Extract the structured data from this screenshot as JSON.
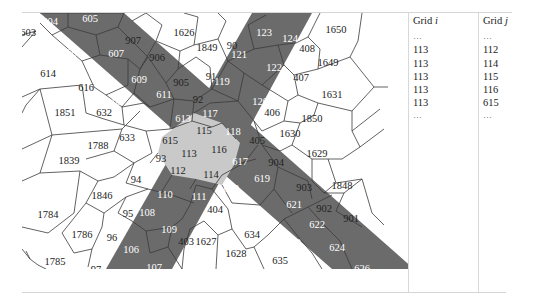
{
  "figure": {
    "colors": {
      "band_dark": "#6b6b6b",
      "intersection_light": "#c9c9c9",
      "cell_white": "#ffffff",
      "edge": "#3a3a3a"
    },
    "cells": [
      {
        "id": "604",
        "x": 28,
        "y": 6,
        "style": "dark"
      },
      {
        "id": "605",
        "x": 68,
        "y": 3,
        "style": "dark"
      },
      {
        "id": "603",
        "x": 6,
        "y": 17,
        "style": "white"
      },
      {
        "id": "606",
        "x": 52,
        "y": 37,
        "style": "dark"
      },
      {
        "id": "607",
        "x": 94,
        "y": 38,
        "style": "dark"
      },
      {
        "id": "907",
        "x": 111,
        "y": 25,
        "style": "white"
      },
      {
        "id": "1626",
        "x": 162,
        "y": 17,
        "style": "white"
      },
      {
        "id": "1849",
        "x": 185,
        "y": 32,
        "style": "white"
      },
      {
        "id": "90",
        "x": 210,
        "y": 30,
        "style": "white"
      },
      {
        "id": "123",
        "x": 242,
        "y": 17,
        "style": "dark"
      },
      {
        "id": "124",
        "x": 268,
        "y": 23,
        "style": "dark"
      },
      {
        "id": "408",
        "x": 285,
        "y": 33,
        "style": "white"
      },
      {
        "id": "1650",
        "x": 314,
        "y": 14,
        "style": "white"
      },
      {
        "id": "1649",
        "x": 306,
        "y": 47,
        "style": "white"
      },
      {
        "id": "614",
        "x": 26,
        "y": 58,
        "style": "white"
      },
      {
        "id": "608",
        "x": 75,
        "y": 59,
        "style": "dark"
      },
      {
        "id": "609",
        "x": 117,
        "y": 64,
        "style": "dark"
      },
      {
        "id": "906",
        "x": 135,
        "y": 42,
        "style": "white"
      },
      {
        "id": "121",
        "x": 217,
        "y": 39,
        "style": "dark"
      },
      {
        "id": "122",
        "x": 252,
        "y": 52,
        "style": "dark"
      },
      {
        "id": "407",
        "x": 279,
        "y": 62,
        "style": "white"
      },
      {
        "id": "616",
        "x": 64,
        "y": 72,
        "style": "white"
      },
      {
        "id": "905",
        "x": 159,
        "y": 67,
        "style": "white"
      },
      {
        "id": "91",
        "x": 189,
        "y": 61,
        "style": "white"
      },
      {
        "id": "119",
        "x": 200,
        "y": 66,
        "style": "dark"
      },
      {
        "id": "1631",
        "x": 310,
        "y": 79,
        "style": "white"
      },
      {
        "id": "611",
        "x": 142,
        "y": 79,
        "style": "dark"
      },
      {
        "id": "92",
        "x": 176,
        "y": 84,
        "style": "white"
      },
      {
        "id": "120",
        "x": 238,
        "y": 86,
        "style": "dark"
      },
      {
        "id": "406",
        "x": 250,
        "y": 97,
        "style": "white"
      },
      {
        "id": "610",
        "x": 91,
        "y": 86,
        "style": "dark"
      },
      {
        "id": "1851",
        "x": 43,
        "y": 97,
        "style": "white"
      },
      {
        "id": "632",
        "x": 82,
        "y": 97,
        "style": "white"
      },
      {
        "id": "612",
        "x": 126,
        "y": 104,
        "style": "dark"
      },
      {
        "id": "613",
        "x": 161,
        "y": 103,
        "style": "dark"
      },
      {
        "id": "117",
        "x": 188,
        "y": 98,
        "style": "dark"
      },
      {
        "id": "1850",
        "x": 290,
        "y": 103,
        "style": "white"
      },
      {
        "id": "115",
        "x": 182,
        "y": 115,
        "style": "light"
      },
      {
        "id": "118",
        "x": 211,
        "y": 116,
        "style": "dark"
      },
      {
        "id": "405",
        "x": 235,
        "y": 125,
        "style": "white"
      },
      {
        "id": "1630",
        "x": 268,
        "y": 118,
        "style": "white"
      },
      {
        "id": "633",
        "x": 105,
        "y": 122,
        "style": "white"
      },
      {
        "id": "615",
        "x": 148,
        "y": 125,
        "style": "light"
      },
      {
        "id": "1788",
        "x": 76,
        "y": 130,
        "style": "white"
      },
      {
        "id": "113",
        "x": 167,
        "y": 138,
        "style": "light"
      },
      {
        "id": "116",
        "x": 197,
        "y": 134,
        "style": "light"
      },
      {
        "id": "617",
        "x": 218,
        "y": 146,
        "style": "dark"
      },
      {
        "id": "1629",
        "x": 295,
        "y": 138,
        "style": "white"
      },
      {
        "id": "93",
        "x": 139,
        "y": 143,
        "style": "white"
      },
      {
        "id": "904",
        "x": 254,
        "y": 147,
        "style": "white"
      },
      {
        "id": "1839",
        "x": 47,
        "y": 145,
        "style": "white"
      },
      {
        "id": "112",
        "x": 156,
        "y": 155,
        "style": "light"
      },
      {
        "id": "114",
        "x": 189,
        "y": 159,
        "style": "light"
      },
      {
        "id": "619",
        "x": 240,
        "y": 163,
        "style": "dark"
      },
      {
        "id": "94",
        "x": 114,
        "y": 164,
        "style": "white"
      },
      {
        "id": "618",
        "x": 209,
        "y": 173,
        "style": "dark"
      },
      {
        "id": "903",
        "x": 282,
        "y": 172,
        "style": "white"
      },
      {
        "id": "1848",
        "x": 320,
        "y": 170,
        "style": "white"
      },
      {
        "id": "110",
        "x": 143,
        "y": 179,
        "style": "dark"
      },
      {
        "id": "111",
        "x": 177,
        "y": 181,
        "style": "dark"
      },
      {
        "id": "621",
        "x": 272,
        "y": 189,
        "style": "dark"
      },
      {
        "id": "1846",
        "x": 80,
        "y": 180,
        "style": "white"
      },
      {
        "id": "404",
        "x": 193,
        "y": 194,
        "style": "white"
      },
      {
        "id": "902",
        "x": 302,
        "y": 193,
        "style": "white"
      },
      {
        "id": "95",
        "x": 106,
        "y": 198,
        "style": "white"
      },
      {
        "id": "108",
        "x": 125,
        "y": 197,
        "style": "dark"
      },
      {
        "id": "1784",
        "x": 26,
        "y": 199,
        "style": "white"
      },
      {
        "id": "901",
        "x": 329,
        "y": 203,
        "style": "white"
      },
      {
        "id": "109",
        "x": 147,
        "y": 214,
        "style": "dark"
      },
      {
        "id": "620",
        "x": 237,
        "y": 206,
        "style": "dark"
      },
      {
        "id": "622",
        "x": 295,
        "y": 209,
        "style": "dark"
      },
      {
        "id": "634",
        "x": 230,
        "y": 219,
        "style": "white"
      },
      {
        "id": "1786",
        "x": 60,
        "y": 219,
        "style": "white"
      },
      {
        "id": "96",
        "x": 90,
        "y": 222,
        "style": "white"
      },
      {
        "id": "403",
        "x": 164,
        "y": 226,
        "style": "white"
      },
      {
        "id": "1627",
        "x": 184,
        "y": 226,
        "style": "white"
      },
      {
        "id": "623",
        "x": 271,
        "y": 227,
        "style": "dark"
      },
      {
        "id": "624",
        "x": 315,
        "y": 232,
        "style": "dark"
      },
      {
        "id": "106",
        "x": 109,
        "y": 234,
        "style": "dark"
      },
      {
        "id": "1628",
        "x": 214,
        "y": 238,
        "style": "white"
      },
      {
        "id": "1785",
        "x": 33,
        "y": 246,
        "style": "white"
      },
      {
        "id": "97",
        "x": 74,
        "y": 254,
        "style": "white"
      },
      {
        "id": "107",
        "x": 132,
        "y": 252,
        "style": "dark"
      },
      {
        "id": "635",
        "x": 258,
        "y": 245,
        "style": "white"
      },
      {
        "id": "625",
        "x": 289,
        "y": 254,
        "style": "dark"
      },
      {
        "id": "626",
        "x": 340,
        "y": 253,
        "style": "dark"
      }
    ]
  },
  "table": {
    "col_i": {
      "header_prefix": "Grid ",
      "header_var": "i",
      "rows": [
        "…",
        "113",
        "113",
        "113",
        "113",
        "113",
        "…"
      ]
    },
    "col_j": {
      "header_prefix": "Grid ",
      "header_var": "j",
      "rows": [
        "…",
        "112",
        "114",
        "115",
        "116",
        "615",
        "…"
      ]
    }
  }
}
